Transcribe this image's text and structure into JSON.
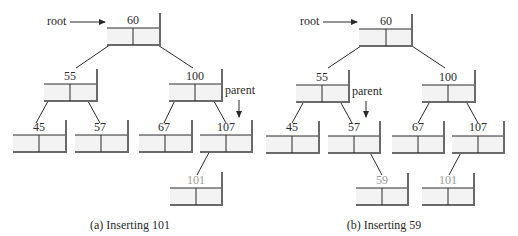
{
  "diagram": {
    "panels": [
      {
        "id": "a",
        "caption": "(a) Inserting 101",
        "pointers": {
          "root": "root",
          "parent": "parent"
        },
        "nodes": [
          {
            "key": "60",
            "new": false
          },
          {
            "key": "55",
            "new": false
          },
          {
            "key": "100",
            "new": false
          },
          {
            "key": "45",
            "new": false
          },
          {
            "key": "57",
            "new": false
          },
          {
            "key": "67",
            "new": false
          },
          {
            "key": "107",
            "new": false
          },
          {
            "key": "101",
            "new": true
          }
        ],
        "edges": [
          [
            "60",
            "55"
          ],
          [
            "60",
            "100"
          ],
          [
            "55",
            "45"
          ],
          [
            "55",
            "57"
          ],
          [
            "100",
            "67"
          ],
          [
            "100",
            "107"
          ],
          [
            "107",
            "101"
          ]
        ],
        "parent_node": "107"
      },
      {
        "id": "b",
        "caption": "(b) Inserting 59",
        "pointers": {
          "root": "root",
          "parent": "parent"
        },
        "nodes": [
          {
            "key": "60",
            "new": false
          },
          {
            "key": "55",
            "new": false
          },
          {
            "key": "100",
            "new": false
          },
          {
            "key": "45",
            "new": false
          },
          {
            "key": "57",
            "new": false
          },
          {
            "key": "67",
            "new": false
          },
          {
            "key": "107",
            "new": false
          },
          {
            "key": "59",
            "new": true
          },
          {
            "key": "101",
            "new": false,
            "faded": true
          }
        ],
        "edges": [
          [
            "60",
            "55"
          ],
          [
            "60",
            "100"
          ],
          [
            "55",
            "45"
          ],
          [
            "55",
            "57"
          ],
          [
            "100",
            "67"
          ],
          [
            "100",
            "107"
          ],
          [
            "57",
            "59"
          ],
          [
            "107",
            "101"
          ]
        ],
        "parent_node": "57"
      }
    ],
    "colors": {
      "line": "#2a2a2a",
      "node_fill": "#f3f3f3",
      "shadow": "#7a7a7a",
      "new_key": "#9a9a9a"
    }
  }
}
